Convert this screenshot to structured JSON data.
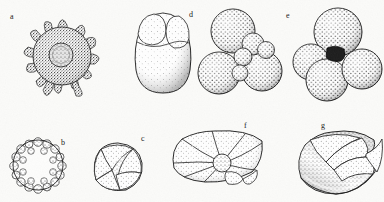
{
  "plate": {
    "kind": "scientific-illustration-plate",
    "subject": "microfossil and protozoan specimens",
    "style": "stippled ink engraving",
    "background_color": "#fbfbf9",
    "ink_color": "#1f1f1f",
    "width": 384,
    "height": 202,
    "rows": 2,
    "specimen_count": 7
  },
  "specimens": [
    {
      "label": "a",
      "label_x": 10,
      "label_y": 16,
      "row": 1,
      "form": "radiolarian-with-radiating-spines",
      "center_x": 62,
      "center_y": 56,
      "body_radius": 30,
      "spine_count": 14,
      "spine_length": 22,
      "has_nucleus": true,
      "nucleus_radius": 12,
      "stipple_density": "high"
    },
    {
      "label": "d",
      "label_x": 190,
      "label_y": 14,
      "row": 1,
      "form": "elongate-biloculine-two-lobed",
      "center_x": 163,
      "center_y": 52,
      "body_width": 46,
      "body_height": 82,
      "chamber_count": 3,
      "stipple_density": "low"
    },
    {
      "label": "e",
      "label_x": 287,
      "label_y": 15,
      "row": 1,
      "form": "globigerinid-multichambered-cluster",
      "center_x": 242,
      "center_y": 55,
      "cluster_radius": 37,
      "chamber_count": 7,
      "stipple_density": "coarse-dots"
    },
    {
      "label": "e",
      "label_x": 287,
      "label_y": 15,
      "row": 1,
      "form": "globigerinid-trilobate-with-dark-aperture",
      "center_x": 333,
      "center_y": 55,
      "cluster_radius": 37,
      "chamber_count": 4,
      "aperture_color": "#1a1a1a",
      "stipple_density": "coarse-dots"
    },
    {
      "label": "b",
      "label_x": 62,
      "label_y": 142,
      "row": 2,
      "form": "spherical-orbulina-with-bubble-ring",
      "center_x": 38,
      "center_y": 165,
      "body_radius": 25,
      "bubble_count": 22,
      "stipple_density": "ring-granules"
    },
    {
      "label": "c",
      "label_x": 142,
      "label_y": 138,
      "row": 2,
      "form": "rounded-spiral-involute-coil",
      "center_x": 118,
      "center_y": 167,
      "body_radius": 24,
      "chamber_count": 5,
      "stipple_density": "medium"
    },
    {
      "label": "f",
      "label_x": 245,
      "label_y": 126,
      "row": 2,
      "form": "discoidal-rotaliid-radiating-chambers",
      "center_x": 215,
      "center_y": 160,
      "body_width": 88,
      "body_height": 58,
      "chamber_count": 9,
      "stipple_density": "fine"
    },
    {
      "label": "g",
      "label_x": 322,
      "label_y": 126,
      "row": 2,
      "form": "nautiloid-spiral-with-keeled-flange",
      "center_x": 336,
      "center_y": 163,
      "body_width": 80,
      "body_height": 62,
      "whorl_count": 3,
      "stipple_density": "graded"
    }
  ]
}
